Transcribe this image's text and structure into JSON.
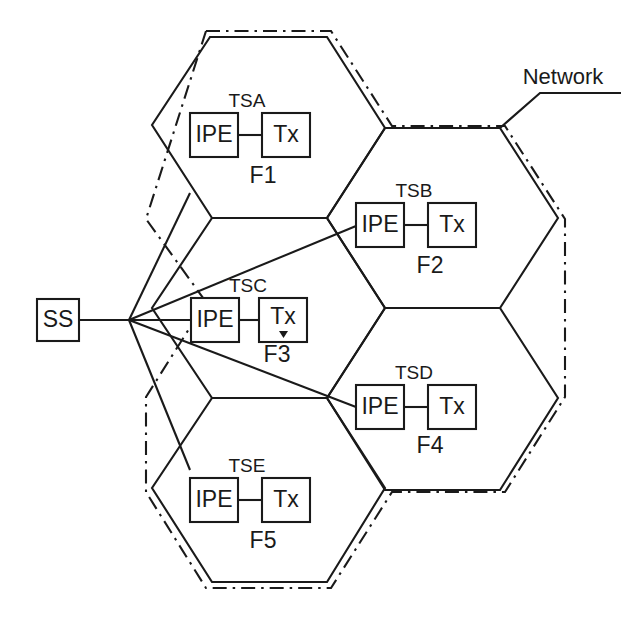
{
  "diagram": {
    "network_label": "Network",
    "switch": {
      "label": "SS",
      "name": "switching-subsystem"
    },
    "box_labels": {
      "ipe": "IPE",
      "tx": "Tx"
    },
    "cells": [
      {
        "id": "F1",
        "cell_label": "F1",
        "ts_label": "TSA",
        "ipe_label": "IPE",
        "tx_label": "Tx"
      },
      {
        "id": "F2",
        "cell_label": "F2",
        "ts_label": "TSB",
        "ipe_label": "IPE",
        "tx_label": "Tx"
      },
      {
        "id": "F3",
        "cell_label": "F3",
        "ts_label": "TSC",
        "ipe_label": "IPE",
        "tx_label": "Tx"
      },
      {
        "id": "F4",
        "cell_label": "F4",
        "ts_label": "TSD",
        "ipe_label": "IPE",
        "tx_label": "Tx"
      },
      {
        "id": "F5",
        "cell_label": "F5",
        "ts_label": "TSE",
        "ipe_label": "IPE",
        "tx_label": "Tx"
      }
    ],
    "colors": {
      "ink": "#1a1a1a",
      "paper": "#ffffff"
    }
  }
}
